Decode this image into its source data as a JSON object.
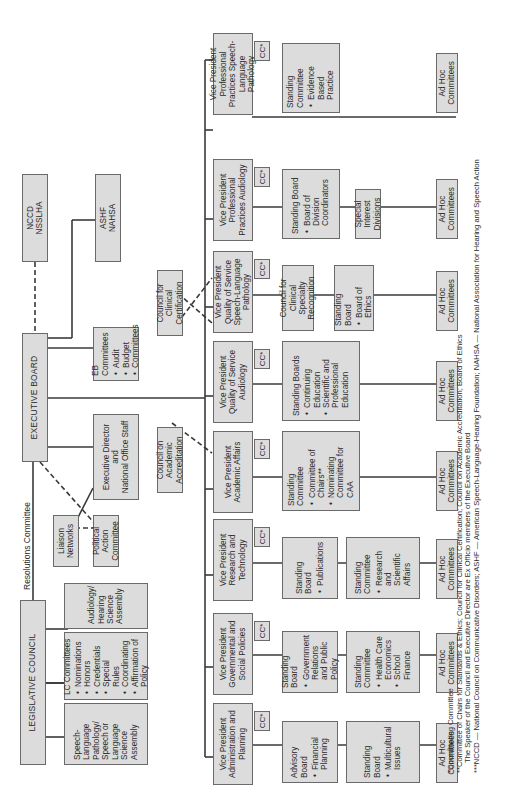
{
  "top": {
    "legislative_council": "LEGISLATIVE COUNCIL",
    "executive_board": "EXECUTIVE BOARD",
    "resolutions_committee": "Resolutions Committee",
    "nccd": {
      "line1": "NCCD",
      "line2": "NSSLHA"
    },
    "ashf": {
      "line1": "ASHF",
      "line2": "NAHSA"
    }
  },
  "lc_children": {
    "slp_assembly": "Speech-Language Pathology/ Speech or Language Science Assembly",
    "lc_committees": {
      "title": "LC Committees",
      "items": [
        "Nominations",
        "Honors",
        "Credentials",
        "Special Rules",
        "Coordinating",
        "Affirmation of Policy"
      ]
    },
    "audiology_assembly": "Audiology/ Hearing Science Assembly"
  },
  "eb_children": {
    "liaison": "Liaison Networks",
    "pac": "Political Action Committee",
    "exec_director": {
      "line1": "Executive Director",
      "line2": "and",
      "line3": "National Office Staff"
    },
    "eb_committees": {
      "title": "EB Committees",
      "items": [
        "Audit",
        "Budget",
        "Committees"
      ]
    },
    "caa": "Council on Academic Accreditation",
    "cfcc": "Council for Clinical Certification"
  },
  "cc_label": "CC*",
  "vps": [
    {
      "title": "Vice President Administration and Planning",
      "children": [
        {
          "title": "Advisory Board",
          "items": [
            "Financial Planning"
          ]
        },
        {
          "title": "Standing Board",
          "items": [
            "Multicultural Issues"
          ]
        }
      ],
      "adhoc": "Ad Hoc Committees"
    },
    {
      "title": "Vice President Governmental and Social Policies",
      "children": [
        {
          "title": "Standing Board",
          "items": [
            "Government Relations and Public Policy"
          ]
        },
        {
          "title": "Standing Committee",
          "items": [
            "Health Care Economics",
            "School Finance"
          ]
        }
      ],
      "adhoc": "Ad Hoc Committees"
    },
    {
      "title": "Vice President Research and Technology",
      "children": [
        {
          "title": "Standing Board",
          "items": [
            "Publications"
          ]
        },
        {
          "title": "Standing Committee",
          "items": [
            "Research and Scientific Affairs"
          ]
        }
      ],
      "adhoc": "Ad Hoc Committees"
    },
    {
      "title": "Vice President Academic Affairs",
      "children": [
        {
          "title": "Standing Committee",
          "items": [
            "Committee of Chairs**",
            "Nominating Committee for CAA"
          ]
        }
      ],
      "adhoc": "Ad Hoc Committees"
    },
    {
      "title": "Vice President Quality of Service Audiology",
      "children": [
        {
          "title": "Standing Boards",
          "items": [
            "Continuing Education",
            "Scientific and Professional Education"
          ]
        }
      ],
      "adhoc": "Ad Hoc Committees"
    },
    {
      "title": "Vice President Quality of Service Speech-Language Pathology",
      "children": [
        {
          "title": "Council for Clinical Specialty Recognition",
          "items": []
        },
        {
          "title": "Standing Board",
          "items": [
            "Board of Ethics"
          ]
        }
      ],
      "adhoc": "Ad Hoc Committees"
    },
    {
      "title": "Vice President Professional Practices Audiology",
      "children": [
        {
          "title": "Standing Board",
          "items": [
            "Board of Division Coordinators"
          ]
        },
        {
          "title": "Special Interest Divisions",
          "items": []
        }
      ],
      "adhoc": "Ad Hoc Committees"
    },
    {
      "title": "Vice President Professional Practices Speech-Language Pathology",
      "children": [
        {
          "title": "Standing Committee",
          "items": [
            "Evidence Based Practice"
          ]
        }
      ],
      "adhoc": "Ad Hoc Committees"
    }
  ],
  "footnotes": {
    "f1": "*Coordinating Committee",
    "f2": "**Committee of Chairs for Standards & Ethics; Council for Clinical Certification; Council on Academic Accreditation; Board of Ethics",
    "f3": "The Speaker of the Council and Executive Director are Ex Officio members of the Executive Board",
    "f4": "***NCCD — National Council on Communicative Disorders; ASHF — American Speech-Language-Hearing Foundation; NAHSA — National Association for Hearing and Speech Action"
  }
}
